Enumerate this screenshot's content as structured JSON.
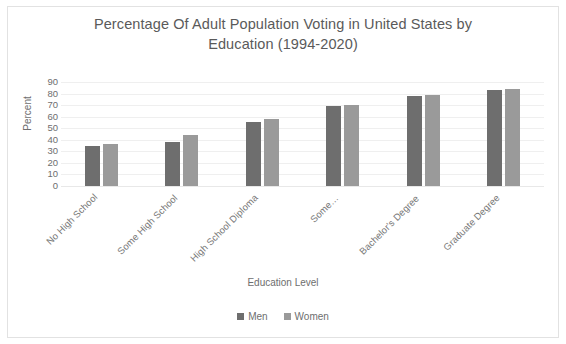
{
  "chart_data": {
    "type": "bar",
    "title": "Percentage Of Adult Population Voting in United States by Education (1994-2020)",
    "title_line1": "Percentage Of Adult Population Voting in United States by",
    "title_line2": "Education (1994-2020)",
    "xlabel": "Education Level",
    "ylabel": "Percent",
    "ylim": [
      0,
      90
    ],
    "ytick_step": 10,
    "yticks": [
      90,
      80,
      70,
      60,
      50,
      40,
      30,
      20,
      10,
      0
    ],
    "grid": true,
    "legend_position": "bottom",
    "categories": [
      "No High School",
      "Some High School",
      "High School Diploma",
      "Some…",
      "Bachelor's Degree",
      "Graduate Degree"
    ],
    "series": [
      {
        "name": "Men",
        "color": "#6e6e6e",
        "values": [
          35,
          38,
          55,
          69,
          78,
          83
        ]
      },
      {
        "name": "Women",
        "color": "#9a9a9a",
        "values": [
          36,
          44,
          58,
          70,
          79,
          84
        ]
      }
    ]
  },
  "legend": {
    "items": [
      {
        "label": "Men",
        "color": "#6e6e6e"
      },
      {
        "label": "Women",
        "color": "#9a9a9a"
      }
    ]
  }
}
